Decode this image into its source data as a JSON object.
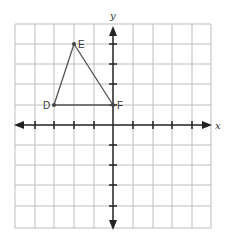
{
  "axes": {
    "x_label": "x",
    "y_label": "y",
    "x_range": [
      -5,
      5
    ],
    "y_range": [
      -5,
      5
    ]
  },
  "points": [
    {
      "label": "D",
      "x": -3,
      "y": 1
    },
    {
      "label": "E",
      "x": -2,
      "y": 4
    },
    {
      "label": "F",
      "x": 0,
      "y": 1
    }
  ],
  "colors": {
    "grid": "#b8b8b8",
    "axis": "#222222",
    "shape": "#555555"
  }
}
